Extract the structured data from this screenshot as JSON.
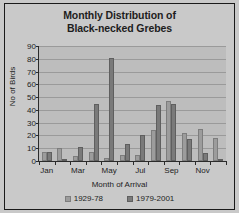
{
  "chart_data": {
    "type": "bar",
    "title": "Monthly Distribution of Black-necked Grebes",
    "title_line1": "Monthly Distribution of",
    "title_line2": "Black-necked Grebes",
    "xlabel": "Month of Arrival",
    "ylabel": "No of Birds",
    "ylim": [
      0,
      90
    ],
    "yticks": [
      0,
      10,
      20,
      30,
      40,
      50,
      60,
      70,
      80,
      90
    ],
    "grid": true,
    "legend_position": "bottom",
    "categories": [
      "Jan",
      "Feb",
      "Mar",
      "Apr",
      "May",
      "Jun",
      "Jul",
      "Aug",
      "Sep",
      "Oct",
      "Nov",
      "Dec"
    ],
    "tick_labels": [
      "Jan",
      "",
      "Mar",
      "",
      "May",
      "",
      "Jul",
      "",
      "Sep",
      "",
      "Nov",
      ""
    ],
    "series": [
      {
        "name": "1929-78",
        "color": "#9c9c9c",
        "values": [
          7,
          10,
          4,
          7,
          2,
          5,
          5,
          24,
          47,
          22,
          25,
          18
        ]
      },
      {
        "name": "1979-2001",
        "color": "#7a7a7a",
        "values": [
          7,
          1,
          11,
          45,
          81,
          13,
          20,
          44,
          45,
          17,
          6,
          0
        ]
      }
    ]
  },
  "legend": {
    "items": [
      {
        "label": "1929-78"
      },
      {
        "label": "1979-2001"
      }
    ]
  }
}
